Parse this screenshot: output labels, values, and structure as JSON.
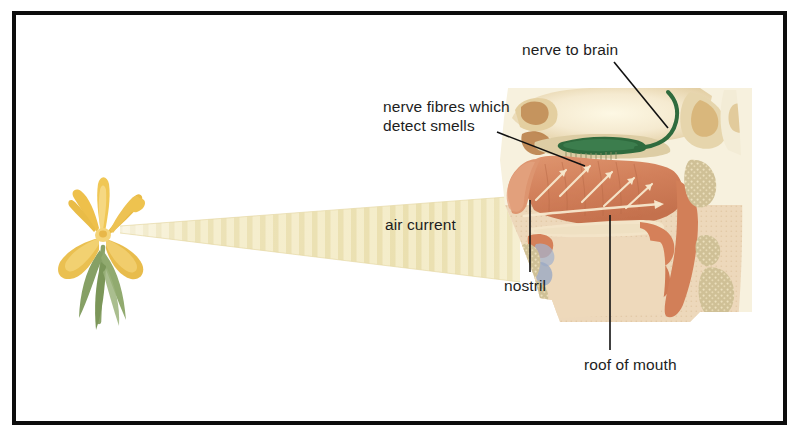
{
  "figure": {
    "frame_color": "#0d0d0d",
    "background": "#ffffff"
  },
  "labels": {
    "nerve_to_brain": "nerve to brain",
    "nerve_fibres_line1": "nerve fibres which",
    "nerve_fibres_line2": "detect smells",
    "air_current": "air current",
    "nostril": "nostril",
    "roof_of_mouth": "roof of mouth"
  },
  "colors": {
    "text": "#1d1d1d",
    "leader_line": "#111111",
    "air_current": "#f2e7bd",
    "air_current_edge": "#e8dca8",
    "flower_petal": "#e8b93f",
    "flower_petal_light": "#f2d071",
    "flower_stem": "#7f9a5c",
    "mucosa": "#d9865e",
    "mucosa_light": "#e2a279",
    "mucosa_deep": "#c0744f",
    "bone": "#cfc096",
    "bone_light": "#e0d4ad",
    "cartilage": "#efe0c4",
    "skull_pale": "#f6efd8",
    "brain_pale": "#f7f0d4",
    "olfactory_bulb": "#2e6b3d",
    "vein_blue": "#9aa9c4",
    "flesh_pale": "#eed9bd",
    "arrow_pale": "#f6e7cd"
  },
  "elements": {
    "flower": "yellow-iris-flower",
    "air_current_shape": "tapered-striped-wedge",
    "anatomy": "sagittal-section-of-human-nose-and-mouth",
    "olfactory_nerve": "green-olfactory-bulb-and-nerve",
    "airflow_arrows": "pale-arrows-in-nasal-cavity"
  },
  "leader_lines": {
    "nerve_to_brain": {
      "from": [
        614,
        62
      ],
      "to": [
        668,
        128
      ]
    },
    "nerve_fibres": {
      "from": [
        497,
        132
      ],
      "to": [
        585,
        166
      ]
    },
    "nostril": {
      "from": [
        530,
        200
      ],
      "to": [
        530,
        272
      ]
    },
    "roof_of_mouth": {
      "from": [
        610,
        215
      ],
      "to": [
        610,
        350
      ]
    }
  }
}
